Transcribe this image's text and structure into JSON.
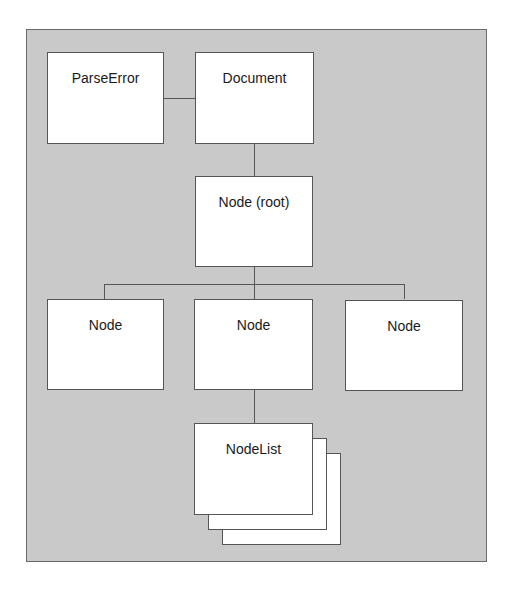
{
  "diagram": {
    "type": "object-hierarchy",
    "nodes": [
      {
        "id": "parse_error",
        "label": "ParseError"
      },
      {
        "id": "document",
        "label": "Document"
      },
      {
        "id": "root",
        "label": "Node (root)"
      },
      {
        "id": "child_left",
        "label": "Node"
      },
      {
        "id": "child_middle",
        "label": "Node"
      },
      {
        "id": "child_right",
        "label": "Node"
      },
      {
        "id": "nodelist",
        "label": "NodeList",
        "stacked": true
      }
    ],
    "edges": [
      {
        "from": "parse_error",
        "to": "document"
      },
      {
        "from": "document",
        "to": "root"
      },
      {
        "from": "root",
        "to": "child_left"
      },
      {
        "from": "root",
        "to": "child_middle"
      },
      {
        "from": "root",
        "to": "child_right"
      },
      {
        "from": "child_middle",
        "to": "nodelist"
      }
    ]
  },
  "colors": {
    "background": "#c9c9c9",
    "box_fill": "#ffffff",
    "stroke": "#555555",
    "text": "#1a1a1a"
  }
}
